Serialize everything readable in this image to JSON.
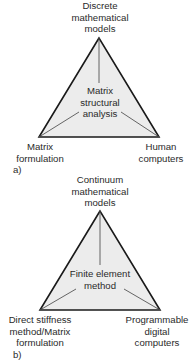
{
  "colors": {
    "background": "#ffffff",
    "triangle_fill": "#ececec",
    "triangle_stroke": "#1a1a1a",
    "spoke_stroke": "#555555",
    "text": "#2a2a2a"
  },
  "diagrams": [
    {
      "id": "a",
      "caption": "a)",
      "top": {
        "lines": [
          "Discrete",
          "mathematical",
          "models"
        ]
      },
      "center": {
        "lines": [
          "Matrix",
          "structural",
          "analysis"
        ]
      },
      "bottom_left": {
        "lines": [
          "Matrix",
          "formulation"
        ]
      },
      "bottom_right": {
        "lines": [
          "Human",
          "computers"
        ]
      }
    },
    {
      "id": "b",
      "caption": "b)",
      "top": {
        "lines": [
          "Continuum",
          "mathematical",
          "models"
        ]
      },
      "center": {
        "lines": [
          "Finite element",
          "method"
        ]
      },
      "bottom_left": {
        "lines": [
          "Direct stiffness",
          "method/Matrix",
          "formulation"
        ]
      },
      "bottom_right": {
        "lines": [
          "Programmable",
          "digital",
          "computers"
        ]
      }
    }
  ]
}
